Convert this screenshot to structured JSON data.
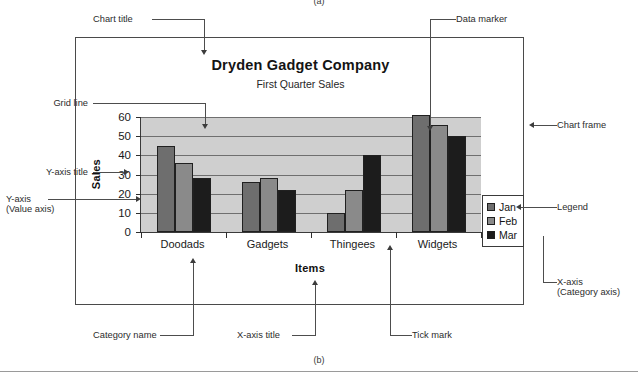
{
  "figure": {
    "label_top": "(a)",
    "label_bottom": "(b)"
  },
  "chart_data": {
    "type": "bar",
    "title": "Dryden Gadget Company",
    "subtitle": "First Quarter Sales",
    "xlabel": "Items",
    "ylabel": "Sales",
    "categories": [
      "Doodads",
      "Gadgets",
      "Thingees",
      "Widgets"
    ],
    "series": [
      {
        "name": "Jan",
        "color": "#6e6e6e",
        "values": [
          45,
          26,
          10,
          61
        ]
      },
      {
        "name": "Feb",
        "color": "#8a8a8a",
        "values": [
          36,
          28,
          22,
          56
        ]
      },
      {
        "name": "Mar",
        "color": "#1c1c1c",
        "values": [
          28,
          22,
          40,
          50
        ]
      }
    ],
    "ylim": [
      0,
      60
    ],
    "yticks": [
      0,
      10,
      20,
      30,
      40,
      50,
      60
    ],
    "ytick_labels": [
      "0",
      "10",
      "20",
      "30",
      "40",
      "50",
      "60"
    ],
    "grid": true,
    "legend_position": "right-inside",
    "plot_background": "#cfcfcf",
    "frame_color": "#4a4a4a"
  },
  "annotations": {
    "chart_title": "Chart title",
    "data_marker": "Data marker",
    "grid_line": "Grid line",
    "y_axis_title": "Y-axis title",
    "y_axis_line1": "Y-axis",
    "y_axis_line2": "(Value axis)",
    "chart_frame": "Chart frame",
    "legend": "Legend",
    "x_axis_line1": "X-axis",
    "x_axis_line2": "(Category axis)",
    "category_name": "Category name",
    "x_axis_title": "X-axis title",
    "tick_mark": "Tick mark"
  }
}
